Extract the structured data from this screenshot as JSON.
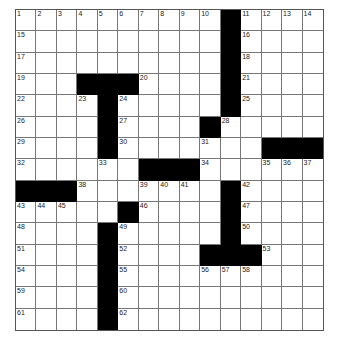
{
  "puzzle": {
    "rows": 15,
    "cols": 15,
    "black_cells": [
      [
        0,
        10
      ],
      [
        1,
        10
      ],
      [
        2,
        10
      ],
      [
        3,
        3
      ],
      [
        3,
        4
      ],
      [
        3,
        5
      ],
      [
        3,
        10
      ],
      [
        4,
        4
      ],
      [
        4,
        10
      ],
      [
        5,
        4
      ],
      [
        5,
        9
      ],
      [
        6,
        4
      ],
      [
        6,
        12
      ],
      [
        6,
        13
      ],
      [
        6,
        14
      ],
      [
        7,
        6
      ],
      [
        7,
        7
      ],
      [
        7,
        8
      ],
      [
        8,
        0
      ],
      [
        8,
        1
      ],
      [
        8,
        2
      ],
      [
        8,
        10
      ],
      [
        9,
        5
      ],
      [
        9,
        10
      ],
      [
        10,
        4
      ],
      [
        10,
        10
      ],
      [
        11,
        4
      ],
      [
        11,
        9
      ],
      [
        11,
        10
      ],
      [
        11,
        11
      ],
      [
        12,
        4
      ],
      [
        13,
        4
      ],
      [
        14,
        4
      ]
    ],
    "numbers": [
      {
        "r": 0,
        "c": 0,
        "n": "1"
      },
      {
        "r": 0,
        "c": 1,
        "n": "2"
      },
      {
        "r": 0,
        "c": 2,
        "n": "3"
      },
      {
        "r": 0,
        "c": 3,
        "n": "4"
      },
      {
        "r": 0,
        "c": 4,
        "n": "5"
      },
      {
        "r": 0,
        "c": 5,
        "n": "6"
      },
      {
        "r": 0,
        "c": 6,
        "n": "7"
      },
      {
        "r": 0,
        "c": 7,
        "n": "8"
      },
      {
        "r": 0,
        "c": 8,
        "n": "9"
      },
      {
        "r": 0,
        "c": 9,
        "n": "10"
      },
      {
        "r": 0,
        "c": 11,
        "n": "11"
      },
      {
        "r": 0,
        "c": 12,
        "n": "12"
      },
      {
        "r": 0,
        "c": 13,
        "n": "13"
      },
      {
        "r": 0,
        "c": 14,
        "n": "14"
      },
      {
        "r": 1,
        "c": 0,
        "n": "15"
      },
      {
        "r": 1,
        "c": 11,
        "n": "16"
      },
      {
        "r": 2,
        "c": 0,
        "n": "17"
      },
      {
        "r": 2,
        "c": 11,
        "n": "18"
      },
      {
        "r": 3,
        "c": 0,
        "n": "19"
      },
      {
        "r": 3,
        "c": 6,
        "n": "20"
      },
      {
        "r": 3,
        "c": 11,
        "n": "21"
      },
      {
        "r": 4,
        "c": 0,
        "n": "22"
      },
      {
        "r": 4,
        "c": 3,
        "n": "23"
      },
      {
        "r": 4,
        "c": 5,
        "n": "24"
      },
      {
        "r": 4,
        "c": 11,
        "n": "25"
      },
      {
        "r": 5,
        "c": 0,
        "n": "26"
      },
      {
        "r": 5,
        "c": 5,
        "n": "27"
      },
      {
        "r": 5,
        "c": 10,
        "n": "28"
      },
      {
        "r": 6,
        "c": 0,
        "n": "29"
      },
      {
        "r": 6,
        "c": 5,
        "n": "30"
      },
      {
        "r": 6,
        "c": 9,
        "n": "31"
      },
      {
        "r": 7,
        "c": 0,
        "n": "32"
      },
      {
        "r": 7,
        "c": 4,
        "n": "33"
      },
      {
        "r": 7,
        "c": 9,
        "n": "34"
      },
      {
        "r": 7,
        "c": 12,
        "n": "35"
      },
      {
        "r": 7,
        "c": 13,
        "n": "36"
      },
      {
        "r": 7,
        "c": 14,
        "n": "37"
      },
      {
        "r": 8,
        "c": 3,
        "n": "38"
      },
      {
        "r": 8,
        "c": 6,
        "n": "39"
      },
      {
        "r": 8,
        "c": 7,
        "n": "40"
      },
      {
        "r": 8,
        "c": 8,
        "n": "41"
      },
      {
        "r": 8,
        "c": 11,
        "n": "42"
      },
      {
        "r": 9,
        "c": 0,
        "n": "43"
      },
      {
        "r": 9,
        "c": 1,
        "n": "44"
      },
      {
        "r": 9,
        "c": 2,
        "n": "45"
      },
      {
        "r": 9,
        "c": 6,
        "n": "46"
      },
      {
        "r": 9,
        "c": 11,
        "n": "47"
      },
      {
        "r": 10,
        "c": 0,
        "n": "48"
      },
      {
        "r": 10,
        "c": 5,
        "n": "49"
      },
      {
        "r": 10,
        "c": 11,
        "n": "50"
      },
      {
        "r": 11,
        "c": 0,
        "n": "51"
      },
      {
        "r": 11,
        "c": 5,
        "n": "52"
      },
      {
        "r": 11,
        "c": 12,
        "n": "53"
      },
      {
        "r": 12,
        "c": 0,
        "n": "54"
      },
      {
        "r": 12,
        "c": 5,
        "n": "55"
      },
      {
        "r": 12,
        "c": 9,
        "n": "56"
      },
      {
        "r": 12,
        "c": 10,
        "n": "57"
      },
      {
        "r": 12,
        "c": 11,
        "n": "58"
      },
      {
        "r": 13,
        "c": 0,
        "n": "59"
      },
      {
        "r": 13,
        "c": 5,
        "n": "60"
      },
      {
        "r": 14,
        "c": 0,
        "n": "61"
      },
      {
        "r": 14,
        "c": 5,
        "n": "62"
      }
    ]
  }
}
